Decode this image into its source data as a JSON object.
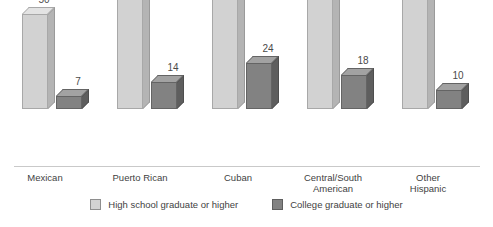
{
  "clipped_title": "",
  "chart_data": {
    "type": "bar",
    "title": "",
    "subtitle": "",
    "xlabel": "",
    "ylabel": "",
    "ylim": [
      0,
      80
    ],
    "grid": false,
    "legend_position": "bottom",
    "categories": [
      "Mexican",
      "Puerto Rican",
      "Cuban",
      "Central/South American",
      "Other Hispanic"
    ],
    "category_lines": [
      [
        "Mexican"
      ],
      [
        "Puerto Rican"
      ],
      [
        "Cuban"
      ],
      [
        "Central/South",
        "American"
      ],
      [
        "Other",
        "Hispanic"
      ]
    ],
    "series": [
      {
        "name": "High school graduate or higher",
        "color": "#d2d2d2",
        "values": [
          50,
          63,
          75,
          65,
          74
        ]
      },
      {
        "name": "College graduate or higher",
        "color": "#828282",
        "values": [
          7,
          14,
          24,
          18,
          10
        ]
      }
    ]
  },
  "legend": {
    "items": [
      {
        "label": "High school graduate or higher"
      },
      {
        "label": "College graduate or higher"
      }
    ]
  },
  "labels": {
    "g0": {
      "cat0": "Mexican",
      "cat1": "",
      "hs": "50",
      "col": "7"
    },
    "g1": {
      "cat0": "Puerto Rican",
      "cat1": "",
      "hs": "63",
      "col": "14"
    },
    "g2": {
      "cat0": "Cuban",
      "cat1": "",
      "hs": "75",
      "col": "24"
    },
    "g3": {
      "cat0": "Central/South",
      "cat1": "American",
      "hs": "65",
      "col": "18"
    },
    "g4": {
      "cat0": "Other",
      "cat1": "Hispanic",
      "hs": "74",
      "col": "10"
    }
  }
}
